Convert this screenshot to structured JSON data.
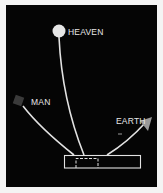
{
  "diagram": {
    "nodes": [
      {
        "id": "heaven",
        "label": "HEAVEN",
        "shape": "circle",
        "color": "#e6e6e6"
      },
      {
        "id": "man",
        "label": "MAN",
        "shape": "square",
        "color": "#3a3a3a"
      },
      {
        "id": "earth",
        "label": "EARTH",
        "shape": "triangle-arrow",
        "color": "#9a9a9a"
      }
    ],
    "base": {
      "shape": "rectangle",
      "inner": "dashed-rectangle"
    },
    "colors": {
      "background": "#050505",
      "frame": "#f4f4f4",
      "line": "#e0e0e0"
    }
  }
}
